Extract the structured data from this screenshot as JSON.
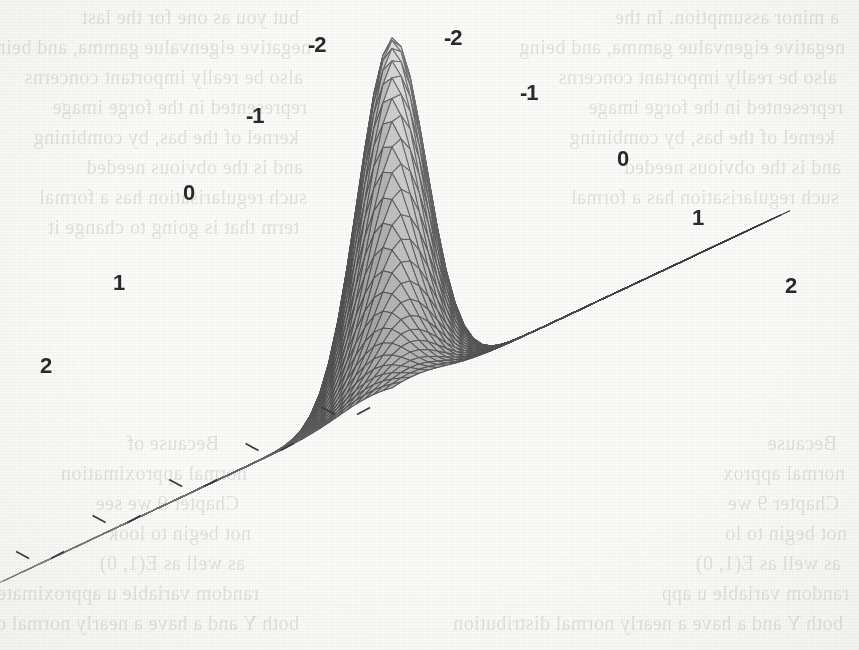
{
  "figure": {
    "kind": "3d-wireframe-surface-plot",
    "background_color": "#fbfbf9",
    "mesh_line_color": "#5f5d58",
    "highlight_color": "#fbfbf8",
    "shadow_color": "#4c4a46"
  },
  "axes": {
    "left_axis": {
      "name": "x-axis",
      "tick_labels": [
        "-2",
        "-1",
        "0",
        "1",
        "2"
      ],
      "label_positions": [
        {
          "text": "-2",
          "x": 308,
          "y": 34
        },
        {
          "text": "-1",
          "x": 246,
          "y": 105
        },
        {
          "text": "0",
          "x": 183,
          "y": 182
        },
        {
          "text": "1",
          "x": 113,
          "y": 272
        },
        {
          "text": "2",
          "x": 40,
          "y": 355
        }
      ]
    },
    "right_axis": {
      "name": "y-axis",
      "tick_labels": [
        "-2",
        "-1",
        "0",
        "1",
        "2"
      ],
      "label_positions": [
        {
          "text": "-2",
          "x": 444,
          "y": 27
        },
        {
          "text": "-1",
          "x": 520,
          "y": 82
        },
        {
          "text": "0",
          "x": 617,
          "y": 148
        },
        {
          "text": "1",
          "x": 692,
          "y": 207
        },
        {
          "text": "2",
          "x": 785,
          "y": 275
        }
      ]
    }
  },
  "chart_data": {
    "type": "surface",
    "title": "",
    "xlabel": "",
    "ylabel": "",
    "zlabel": "",
    "xlim": [
      -2.6,
      2.6
    ],
    "ylim": [
      -2.6,
      2.6
    ],
    "xticks": [
      -2,
      -1,
      0,
      1,
      2
    ],
    "yticks": [
      -2,
      -1,
      0,
      1,
      2
    ],
    "grid": true,
    "legend": "none",
    "function": "bivariate normal density, rho = 0.9",
    "grid_resolution": 44,
    "peak_value": 1.0,
    "peak_location": [
      0,
      0
    ]
  },
  "ghost_text": {
    "note": "faint show-through text from the opposite side of the scanned page",
    "left_column": [
      "but you as one for the last",
      "negative eigenvalue gamma, and being",
      "also be really important concerns",
      "represented in the  forge image",
      "kernel of the bas, by combining",
      "and is the obvious needed",
      "such regularisation has a formal",
      "term that is going to change it"
    ],
    "right_column": [
      "a minor assumption. In the",
      "negative eigenvalue gamma, and being",
      "also be really important concerns",
      "represented in the  forge image",
      "kernel of the bas, by combining",
      "and is the obvious needed",
      "such regularisation has a formal"
    ],
    "lower_left": [
      "Because  of",
      "normal approximation",
      "Chapter 9 we see",
      "not begin to look",
      "as well as E(1, 0)",
      "random variable u approximately",
      "both Y and a have a nearly normal distribution"
    ],
    "lower_right": [
      "Because",
      "normal approx",
      "Chapter 9 we",
      "not begin to lo",
      "as well as E(1, 0)",
      "random variable u app",
      "both Y and a have a nearly normal distribution"
    ]
  }
}
